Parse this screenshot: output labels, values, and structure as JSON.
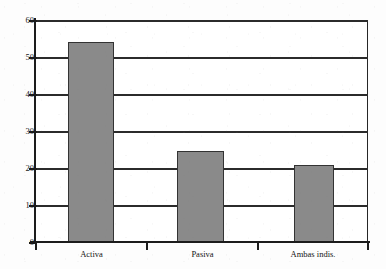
{
  "chart_data": {
    "type": "bar",
    "title": "",
    "subtitle": "",
    "xlabel": "",
    "ylabel": "",
    "categories": [
      "Activa",
      "Pasiva",
      "Ambas indis."
    ],
    "values": [
      54.0,
      24.7,
      20.7
    ],
    "ylim": [
      0,
      60
    ],
    "y_ticks": [
      0,
      10,
      20,
      30,
      40,
      50,
      60
    ],
    "y_tick_labels": [
      "0",
      "10",
      "20",
      "30",
      "40",
      "50",
      "60"
    ],
    "grid": true,
    "grid_axis": "y",
    "legend": null,
    "legend_position": "none",
    "annotations": [],
    "series": [
      {
        "name": "",
        "values": [
          54.0,
          24.7,
          20.7
        ]
      }
    ],
    "colors": {
      "bar_fill": "#8a8a8a",
      "bar_edge": "#333333",
      "axis": "#1c1c1c",
      "grid": "#2b2b2b",
      "background": "#ffffff",
      "text": "#141414"
    }
  }
}
